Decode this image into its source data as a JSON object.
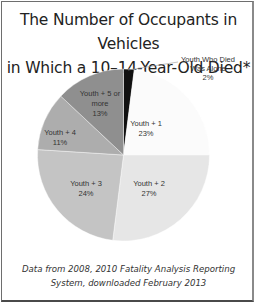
{
  "chart_data": {
    "type": "pie",
    "title": "The Number of Occupants in Vehicles in Which a 10–14-Year-Old Died*",
    "categories": [
      "Youth Who Died Was Alone",
      "Youth + 1",
      "Youth + 2",
      "Youth + 3",
      "Youth + 4",
      "Youth + 5 or more"
    ],
    "values": [
      2,
      23,
      27,
      24,
      11,
      13
    ],
    "labels": [
      "2%",
      "23%",
      "27%",
      "24%",
      "11%",
      "13%"
    ],
    "colors": [
      "#111111",
      "#fbfbfb",
      "#e6e6e6",
      "#c4c4c4",
      "#adadad",
      "#8f8f8f"
    ],
    "start_angle_deg": 0,
    "direction": "clockwise",
    "legend": "none (data labels on slices)",
    "source_note": "Data from 2008, 2010 Fatality Analysis Reporting System, downloaded February 2013"
  },
  "title_lines": [
    "The Number of Occupants in Vehicles",
    "in Which a 10–14-Year-Old Died*"
  ],
  "slices": [
    {
      "name_lines": [
        "Youth Who Died",
        "Was Alone"
      ],
      "pct": "2%"
    },
    {
      "name_lines": [
        "Youth + 1"
      ],
      "pct": "23%"
    },
    {
      "name_lines": [
        "Youth + 2"
      ],
      "pct": "27%"
    },
    {
      "name_lines": [
        "Youth + 3"
      ],
      "pct": "24%"
    },
    {
      "name_lines": [
        "Youth + 4"
      ],
      "pct": "11%"
    },
    {
      "name_lines": [
        "Youth + 5 or",
        "more"
      ],
      "pct": "13%"
    }
  ],
  "source_lines": [
    "Data from 2008, 2010 Fatality Analysis Reporting",
    "System, downloaded February 2013"
  ]
}
